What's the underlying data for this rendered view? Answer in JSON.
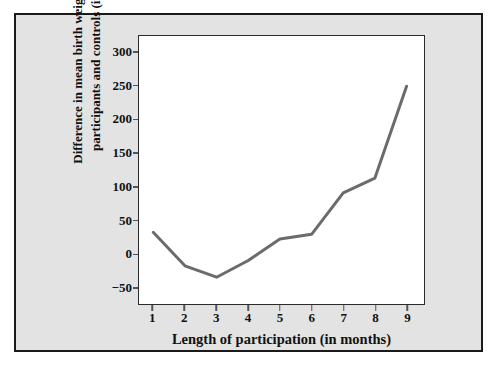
{
  "figure": {
    "background_color": "#e3e3e3",
    "border_color": "#1a1a1a",
    "plot_background_color": "#ffffff",
    "plot_border_color": "#2b2b2b"
  },
  "chart_data": {
    "type": "line",
    "title": "",
    "subtitle": "",
    "xlabel": "Length of participation (in months)",
    "ylabel": "Difference in mean birth weight between participants and controls (in grams)",
    "ylabel_line1": "Difference in mean birth weight between",
    "ylabel_line2": "participants and controls (in grams)",
    "x": [
      1,
      2,
      3,
      4,
      5,
      6,
      7,
      8,
      9
    ],
    "values": [
      32,
      -18,
      -35,
      -10,
      22,
      29,
      91,
      113,
      250
    ],
    "series": [
      {
        "name": "Difference in mean birth weight",
        "values": [
          32,
          -18,
          -35,
          -10,
          22,
          29,
          91,
          113,
          250
        ],
        "color": "#6b6b6b"
      }
    ],
    "xticks": [
      1,
      2,
      3,
      4,
      5,
      6,
      7,
      8,
      9
    ],
    "xtick_labels": [
      "1",
      "2",
      "3",
      "4",
      "5",
      "6",
      "7",
      "8",
      "9"
    ],
    "yticks": [
      -50,
      0,
      50,
      100,
      150,
      200,
      250,
      300
    ],
    "ytick_labels": [
      "−50",
      "0",
      "50",
      "100",
      "150",
      "200",
      "250",
      "300"
    ],
    "xlim": [
      0.55,
      9.55
    ],
    "ylim": [
      -75,
      325
    ],
    "grid": false,
    "legend": false,
    "legend_position": "none",
    "line_color": "#6b6b6b",
    "line_width": 3,
    "markers": false,
    "annotations": []
  }
}
